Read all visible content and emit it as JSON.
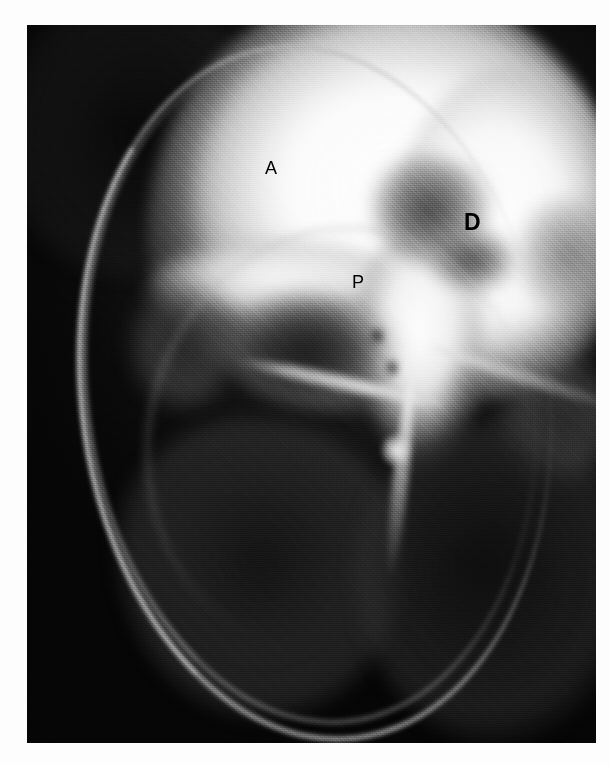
{
  "figure": {
    "kind": "radiograph",
    "modality_hint": "angiogram",
    "background_color": "#ffffff",
    "plate_color": "#0a0a0a",
    "plate": {
      "x": 27,
      "y": 25,
      "width": 569,
      "height": 718
    }
  },
  "annotations": [
    {
      "id": "label-a",
      "text": "A",
      "weight": "regular",
      "font_size": 18,
      "color": "#000000",
      "x": 265,
      "y": 159
    },
    {
      "id": "label-p",
      "text": "P",
      "weight": "regular",
      "font_size": 18,
      "color": "#000000",
      "x": 352,
      "y": 273
    },
    {
      "id": "label-d",
      "text": "D",
      "weight": "bold",
      "font_size": 23,
      "color": "#000000",
      "x": 464,
      "y": 211
    }
  ]
}
